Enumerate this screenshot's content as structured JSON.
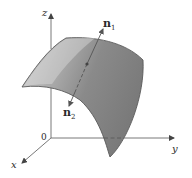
{
  "figure": {
    "type": "3d-surface-with-normals",
    "axes": {
      "z_label": "z",
      "y_label": "y",
      "x_label": "x",
      "origin_label": "0"
    },
    "normals": {
      "n1": {
        "letter": "n",
        "subscript": "1"
      },
      "n2": {
        "letter": "n",
        "subscript": "2"
      }
    },
    "colors": {
      "surface_light": "#c4c4c4",
      "surface_dark": "#7d7d7d",
      "surface_edge": "#5a5a5a",
      "axis": "#444444",
      "background": "#ffffff"
    }
  }
}
